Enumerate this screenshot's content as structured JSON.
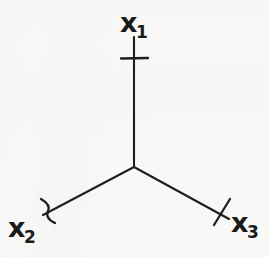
{
  "figure": {
    "type": "diagram",
    "subtype": "three-point-vertex",
    "background_color": "#f8f8f7",
    "ink_color": "#1a1a1a",
    "width": 269,
    "height": 257,
    "vertex": {
      "x": 134,
      "y": 167,
      "label": ""
    },
    "legs": [
      {
        "id": "leg-x1",
        "label_base": "x",
        "label_sub": "1",
        "direction": "up",
        "start": {
          "x": 134,
          "y": 167
        },
        "end": {
          "x": 134,
          "y": 37
        },
        "tick": {
          "x": 134,
          "y": 58,
          "style": "straight",
          "length": 27
        }
      },
      {
        "id": "leg-x2",
        "label_base": "x",
        "label_sub": "2",
        "direction": "down-left",
        "start": {
          "x": 134,
          "y": 167
        },
        "end": {
          "x": 43,
          "y": 215
        },
        "tick": {
          "x": 47,
          "y": 211,
          "style": "curved",
          "length": 26
        }
      },
      {
        "id": "leg-x3",
        "label_base": "x",
        "label_sub": "3",
        "direction": "down-right",
        "start": {
          "x": 134,
          "y": 167
        },
        "end": {
          "x": 229,
          "y": 219
        },
        "tick": {
          "x": 222,
          "y": 212,
          "style": "straight",
          "length": 27
        }
      }
    ],
    "labels": [
      {
        "id": "label-x1",
        "base": "x",
        "sub": "1"
      },
      {
        "id": "label-x2",
        "base": "x",
        "sub": "2"
      },
      {
        "id": "label-x3",
        "base": "x",
        "sub": "3"
      }
    ]
  }
}
